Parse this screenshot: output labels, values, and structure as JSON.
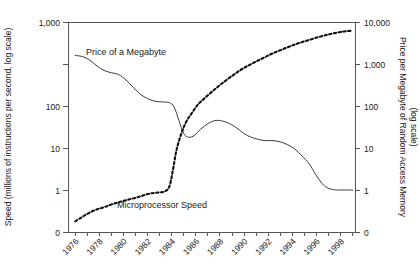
{
  "chart_data": {
    "type": "line",
    "title": "",
    "subtitle": "",
    "grid": false,
    "legend_position": "inline-annotation",
    "xlabel": "",
    "x_axis": {
      "ticks": [
        1976,
        1977,
        1978,
        1979,
        1980,
        1981,
        1982,
        1983,
        1984,
        1985,
        1986,
        1987,
        1988,
        1989,
        1990,
        1991,
        1992,
        1993,
        1994,
        1995,
        1996,
        1997,
        1998,
        1999
      ],
      "labeled_ticks": [
        "1976",
        "1978",
        "1980",
        "1982",
        "1984",
        "1986",
        "1988",
        "1990",
        "1992",
        "1994",
        "1996",
        "1998"
      ],
      "range": [
        1975.4,
        1999.2
      ]
    },
    "y_axis_left": {
      "label": "Speed (millions of instructions per second, log scale)",
      "tick_labels": [
        "1,000",
        "100",
        "10",
        "1",
        "0"
      ],
      "tick_values": [
        1000,
        100,
        10,
        1,
        0
      ],
      "scale": "log"
    },
    "y_axis_right": {
      "label": "Price per Megabyte of Random Access Memory",
      "label_line2": "(log scale)",
      "tick_labels": [
        "10,000",
        "1,000",
        "100",
        "10",
        "1",
        "0"
      ],
      "tick_values": [
        10000,
        1000,
        100,
        10,
        1,
        0
      ],
      "scale": "log"
    },
    "series": [
      {
        "name": "Price of a Megabyte",
        "axis": "right",
        "style": "solid",
        "annotation": "Price of a Megabyte",
        "units": "US dollars per megabyte",
        "x": [
          1976.0,
          1976.6,
          1977.2,
          1977.8,
          1978.4,
          1979.0,
          1979.6,
          1980.2,
          1980.8,
          1981.4,
          1982.0,
          1982.6,
          1983.2,
          1983.8,
          1984.2,
          1984.6,
          1985.0,
          1985.4,
          1985.9,
          1986.4,
          1987.0,
          1987.6,
          1988.2,
          1988.8,
          1989.4,
          1990.0,
          1990.6,
          1991.2,
          1991.8,
          1992.4,
          1993.0,
          1993.6,
          1994.2,
          1994.8,
          1995.4,
          1996.0,
          1996.6,
          1997.2,
          1997.8,
          1998.4,
          1999.0
        ],
        "y": [
          1600,
          1500,
          1250,
          900,
          700,
          620,
          560,
          420,
          280,
          190,
          150,
          130,
          125,
          120,
          95,
          45,
          22,
          18,
          20,
          28,
          38,
          45,
          44,
          38,
          30,
          22,
          18,
          16,
          15,
          15,
          14,
          12,
          9.5,
          6.5,
          4.2,
          2.2,
          1.3,
          1.05,
          1.0,
          1.0,
          1.0
        ]
      },
      {
        "name": "Microprocessor Speed",
        "axis": "left",
        "style": "dotted",
        "annotation": "Microprocessor Speed",
        "units": "millions of instructions per second",
        "x": [
          1976.0,
          1976.5,
          1977.0,
          1977.5,
          1978.0,
          1978.5,
          1979.0,
          1979.5,
          1980.0,
          1980.5,
          1981.0,
          1981.5,
          1982.0,
          1982.5,
          1983.0,
          1983.4,
          1983.8,
          1984.1,
          1984.4,
          1984.8,
          1985.2,
          1985.7,
          1986.2,
          1986.8,
          1987.5,
          1988.2,
          1989.0,
          1989.8,
          1990.6,
          1991.5,
          1992.4,
          1993.3,
          1994.2,
          1995.2,
          1996.2,
          1997.2,
          1998.2,
          1999.0
        ],
        "y": [
          0.18,
          0.22,
          0.27,
          0.32,
          0.36,
          0.4,
          0.45,
          0.5,
          0.55,
          0.6,
          0.65,
          0.72,
          0.8,
          0.85,
          0.88,
          0.92,
          1.2,
          3.0,
          9.0,
          22,
          42,
          70,
          110,
          160,
          240,
          350,
          520,
          750,
          1000,
          1350,
          1800,
          2300,
          2900,
          3600,
          4400,
          5200,
          5900,
          6200
        ]
      }
    ]
  }
}
